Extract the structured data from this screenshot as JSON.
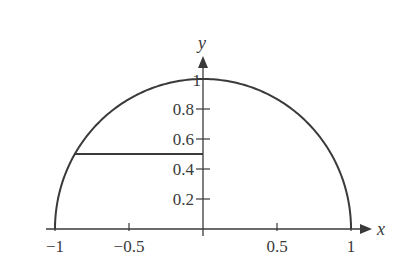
{
  "chart_data": {
    "type": "line",
    "title": "",
    "xlabel": "x",
    "ylabel": "y",
    "xlim": [
      -1,
      1
    ],
    "ylim": [
      0,
      1
    ],
    "grid": false,
    "legend": null,
    "series": [
      {
        "name": "upper unit semicircle y = sqrt(1 - x^2)",
        "x": [
          -1,
          -0.866,
          -0.5,
          0,
          0.5,
          0.866,
          1
        ],
        "y": [
          0,
          0.5,
          0.866,
          1,
          0.866,
          0.5,
          0
        ]
      },
      {
        "name": "horizontal segment at y = 0.5",
        "x": [
          -0.866,
          0
        ],
        "y": [
          0.5,
          0.5
        ]
      }
    ],
    "x_ticks": [
      -1,
      -0.5,
      0.5,
      1
    ],
    "x_tick_labels": [
      "−1",
      "−0.5",
      "0.5",
      "1"
    ],
    "y_ticks": [
      0.2,
      0.4,
      0.6,
      0.8,
      1
    ],
    "y_tick_labels": [
      "0.2",
      "0.4",
      "0.6",
      "0.8",
      "1"
    ]
  },
  "colors": {
    "curve": "#3a3a3a",
    "axes": "#3a3a3a",
    "background": "#ffffff"
  }
}
